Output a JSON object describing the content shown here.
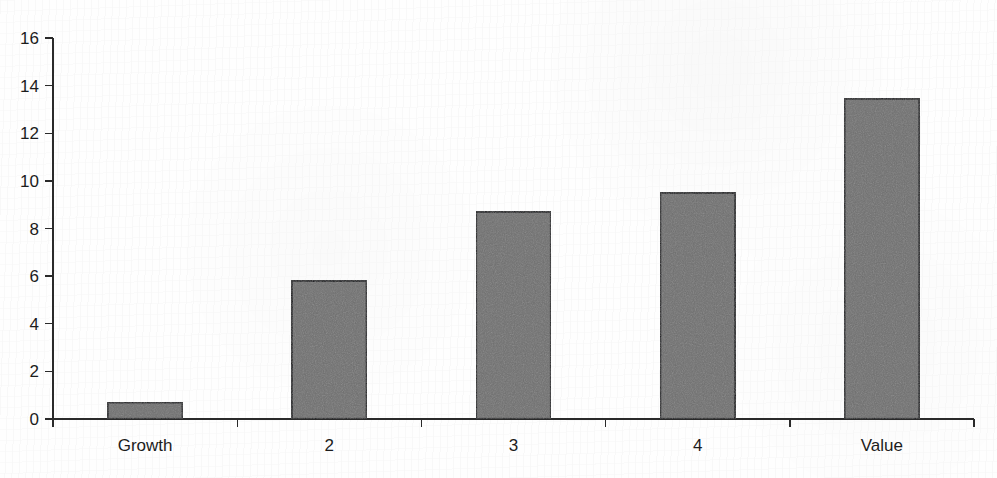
{
  "figure": {
    "background_color": "#fefefe",
    "ink_color": "#1c1c1c",
    "bar_fill_color": "#6f6f6f",
    "bar_edge_color": "#15161a",
    "axis_color": "#2a2a2a"
  },
  "chart_data": {
    "type": "bar",
    "title": "",
    "subtitle": "",
    "xlabel": "",
    "ylabel": "",
    "categories": [
      "Growth",
      "2",
      "3",
      "4",
      "Value"
    ],
    "values": [
      0.7,
      5.8,
      8.7,
      9.5,
      13.45
    ],
    "series": [
      {
        "name": "",
        "values": [
          0.7,
          5.8,
          8.7,
          9.5,
          13.45
        ]
      }
    ],
    "ylim": [
      0,
      16
    ],
    "xlim": [
      0,
      5
    ],
    "y_ticks": [
      0,
      2,
      4,
      6,
      8,
      10,
      12,
      14,
      16
    ],
    "y_tick_labels": [
      "0",
      "2",
      "4",
      "6",
      "8",
      "10",
      "12",
      "14",
      "16"
    ],
    "x_tick_labels": [
      "Growth",
      "2",
      "3",
      "4",
      "Value"
    ],
    "grid": false,
    "legend": false,
    "legend_position": "none",
    "annotations": []
  }
}
